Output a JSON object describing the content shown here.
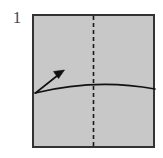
{
  "figure": {
    "step_number": "1",
    "type": "origami-diagram",
    "canvas": {
      "width": 163,
      "height": 158,
      "background": "#ffffff"
    },
    "paper": {
      "shape": "square",
      "x": 32,
      "y": 14,
      "width": 123,
      "height": 134,
      "fill_color": "#c8c8c8",
      "border_color": "#333333",
      "border_width": 2
    },
    "crease_line": {
      "name": "vertical-center-crease",
      "style": "dashed",
      "orientation": "vertical",
      "x": 93.5,
      "y_start": 15,
      "y_end": 147,
      "color": "#1a1a1a",
      "stroke_width": 1.6,
      "dash_pattern": "4 3"
    },
    "fold_arc": {
      "name": "fold-arc",
      "color": "#111111",
      "stroke_width": 1.6,
      "path": "M 35 93 Q 96 78 155 89"
    },
    "fold_arrow": {
      "name": "fold-arrow",
      "color": "#111111",
      "stroke_width": 1.6,
      "shaft_path": "M 35.5 93 L 60 73.5",
      "head_points": "64.5,70 53.5,71.5 58.5,78.5",
      "direction": "up-right"
    }
  }
}
